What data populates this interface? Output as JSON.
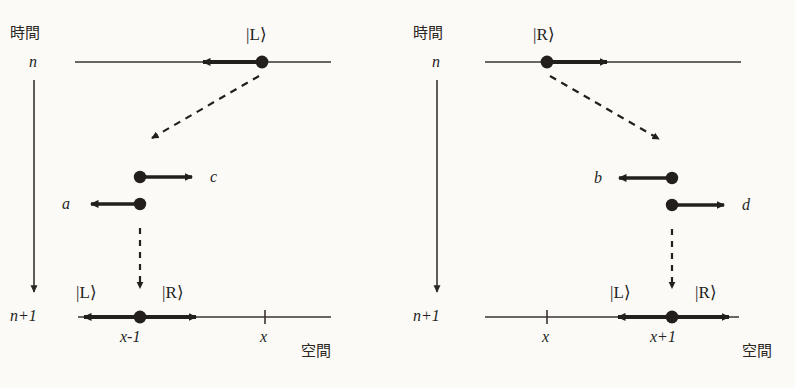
{
  "figure": {
    "title_left_axis": "時間",
    "title_right_axis": "時間",
    "space_label_left": "空間",
    "space_label_right": "空間",
    "colors": {
      "ink": "#231f1c",
      "thin_line": "#3a3430",
      "background": "#fbfaf7"
    }
  },
  "panels": [
    {
      "id": "left",
      "time_axis_label": "時間",
      "space_axis_label": "空間",
      "row_n_label": "n",
      "row_n1_label": "n+1",
      "incoming_state": "|L⟩",
      "incoming_direction": "left",
      "amplitudes": [
        {
          "name": "c",
          "direction": "right",
          "label_side": "right"
        },
        {
          "name": "a",
          "direction": "left",
          "label_side": "left"
        }
      ],
      "result_ket_left": "|L⟩",
      "result_ket_right": "|R⟩",
      "site_label_main": "x-1",
      "site_label_tick": "x"
    },
    {
      "id": "right",
      "time_axis_label": "時間",
      "space_axis_label": "空間",
      "row_n_label": "n",
      "row_n1_label": "n+1",
      "incoming_state": "|R⟩",
      "incoming_direction": "right",
      "amplitudes": [
        {
          "name": "b",
          "direction": "left",
          "label_side": "left"
        },
        {
          "name": "d",
          "direction": "right",
          "label_side": "right"
        }
      ],
      "result_ket_left": "|L⟩",
      "result_ket_right": "|R⟩",
      "site_label_main": "x+1",
      "site_label_tick": "x"
    }
  ],
  "labels": {
    "left": {
      "time": "時間",
      "n": "n",
      "n1": "n+1",
      "ket_top": "|L⟩",
      "amp_c": "c",
      "amp_a": "a",
      "ket_L": "|L⟩",
      "ket_R": "|R⟩",
      "site_main": "x-1",
      "site_tick": "x",
      "space": "空間"
    },
    "right": {
      "time": "時間",
      "n": "n",
      "n1": "n+1",
      "ket_top": "|R⟩",
      "amp_b": "b",
      "amp_d": "d",
      "ket_L": "|L⟩",
      "ket_R": "|R⟩",
      "site_main": "x+1",
      "site_tick": "x",
      "space": "空間"
    }
  }
}
